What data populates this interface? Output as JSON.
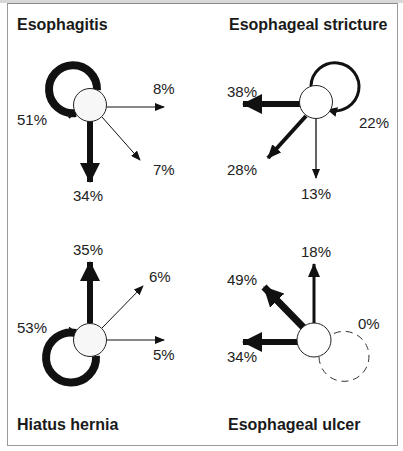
{
  "panels": [
    {
      "title": "Esophagitis",
      "self_loop": "51%",
      "labels": {
        "right": "8%",
        "diagonal": "7%",
        "down": "34%"
      }
    },
    {
      "title": "Esophageal stricture",
      "self_loop": "22%",
      "labels": {
        "left": "38%",
        "diagonal": "28%",
        "down": "13%"
      }
    },
    {
      "title": "Hiatus hernia",
      "self_loop": "53%",
      "labels": {
        "up": "35%",
        "diagonal": "6%",
        "right": "5%"
      }
    },
    {
      "title": "Esophageal ulcer",
      "self_loop": "0%",
      "labels": {
        "up": "18%",
        "diagonal": "49%",
        "left": "34%"
      }
    }
  ],
  "colors": {
    "stroke": "#111111",
    "node_fill": "#f7f7f7",
    "frame": "#9a9a9a"
  }
}
